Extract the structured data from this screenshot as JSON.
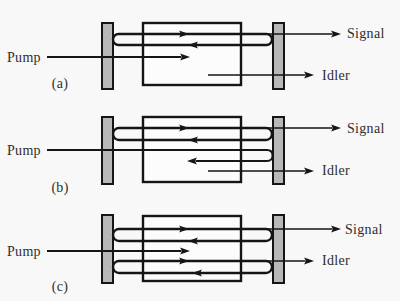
{
  "figure": {
    "panels": [
      {
        "label": "(a)",
        "pump": "Pump",
        "signal": "Signal",
        "idler": "Idler"
      },
      {
        "label": "(b)",
        "pump": "Pump",
        "signal": "Signal",
        "idler": "Idler"
      },
      {
        "label": "(c)",
        "pump": "Pump",
        "signal": "Signal",
        "idler": "Idler"
      }
    ]
  },
  "colors": {
    "line": "#151515",
    "mirror_fill": "#b8b8b8",
    "crystal_fill": "#fcfcfc",
    "background": "#f8f8f8",
    "text": "#2e2e2e"
  }
}
